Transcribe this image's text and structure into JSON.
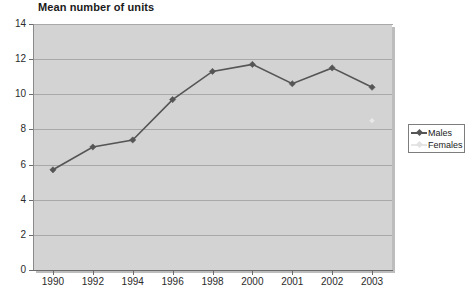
{
  "chart_data": {
    "type": "line",
    "title": "Mean number of units",
    "xlabel": "",
    "ylabel": "",
    "categories": [
      "1990",
      "1992",
      "1994",
      "1996",
      "1998",
      "2000",
      "2001",
      "2002",
      "2003"
    ],
    "series": [
      {
        "name": "Males",
        "color": "#555555",
        "marker": "diamond",
        "values": [
          5.7,
          7.0,
          7.4,
          9.7,
          11.3,
          11.7,
          10.6,
          11.5,
          10.4
        ]
      },
      {
        "name": "Females",
        "color": "#e8e8e8",
        "marker": "square",
        "values": [
          null,
          null,
          null,
          null,
          null,
          null,
          null,
          null,
          8.5
        ]
      }
    ],
    "ylim": [
      0,
      14
    ],
    "yticks": [
      0,
      2,
      4,
      6,
      8,
      10,
      12,
      14
    ],
    "ytick_labels": [
      "0",
      "2",
      "4",
      "6",
      "8",
      "10",
      "12",
      "14"
    ],
    "grid": "horizontal",
    "legend_position": "right",
    "plot_background": "#d3d3d3",
    "page_background": "#ffffff",
    "gridline_color": "#a8a8a8",
    "axis_color": "#6b6b6b"
  },
  "legend": {
    "items": [
      {
        "label": "Males"
      },
      {
        "label": "Females"
      }
    ]
  }
}
